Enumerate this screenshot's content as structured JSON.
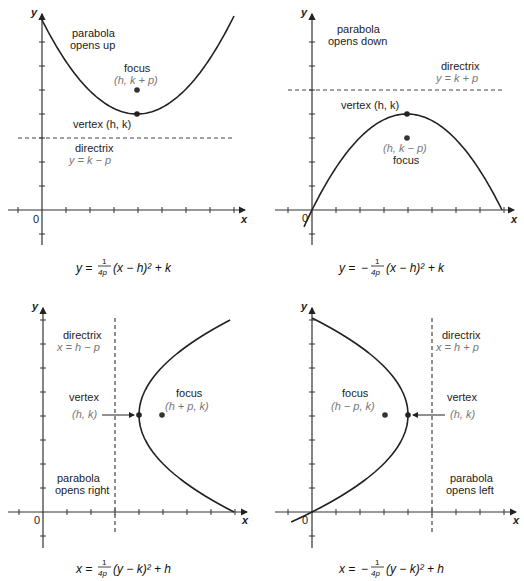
{
  "panels": [
    {
      "id": "opens-up",
      "title_line1": "parabola",
      "title_line2": "opens up",
      "focus_label": "focus",
      "focus_coords": "(h, k + p)",
      "vertex_label": "vertex (h, k)",
      "directrix_label": "directrix",
      "directrix_eq": "y = k − p",
      "origin": "0",
      "x_axis": "x",
      "y_axis": "y",
      "equation": {
        "lhs": "y =",
        "sign": "",
        "num": "1",
        "den": "4p",
        "rest": "(x − h)² + k"
      }
    },
    {
      "id": "opens-down",
      "title_line1": "parabola",
      "title_line2": "opens down",
      "focus_label": "focus",
      "focus_coords": "(h, k − p)",
      "vertex_label": "vertex (h, k)",
      "directrix_label": "directrix",
      "directrix_eq": "y = k + p",
      "origin": "0",
      "x_axis": "x",
      "y_axis": "y",
      "equation": {
        "lhs": "y =",
        "sign": "−",
        "num": "1",
        "den": "4p",
        "rest": "(x − h)² + k"
      }
    },
    {
      "id": "opens-right",
      "title_line1": "parabola",
      "title_line2": "opens right",
      "focus_label": "focus",
      "focus_coords": "(h + p, k)",
      "vertex_label": "vertex",
      "vertex_coords": "(h, k)",
      "directrix_label": "directrix",
      "directrix_eq": "x = h − p",
      "origin": "0",
      "x_axis": "x",
      "y_axis": "y",
      "equation": {
        "lhs": "x =",
        "sign": "",
        "num": "1",
        "den": "4p",
        "rest": "(y − k)² + h"
      }
    },
    {
      "id": "opens-left",
      "title_line1": "parabola",
      "title_line2": "opens left",
      "focus_label": "focus",
      "focus_coords": "(h − p, k)",
      "vertex_label": "vertex",
      "vertex_coords": "(h, k)",
      "directrix_label": "directrix",
      "directrix_eq": "x = h + p",
      "origin": "0",
      "x_axis": "x",
      "y_axis": "y",
      "equation": {
        "lhs": "x =",
        "sign": "−",
        "num": "1",
        "den": "4p",
        "rest": "(y − k)² + h"
      }
    }
  ],
  "colors": {
    "curve": "#222222",
    "axis": "#333333",
    "directrix_line": "#444444",
    "secondary_text": "#777777"
  }
}
